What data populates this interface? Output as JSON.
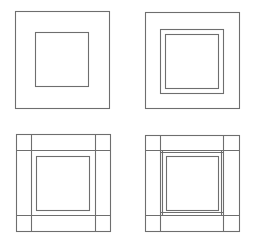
{
  "diagram": {
    "stroke_color": "#6e6e6e",
    "background": "#ffffff",
    "panels": [
      {
        "id": "panel-1",
        "position": "top-left",
        "outer_square": {
          "x": 15,
          "y": 11,
          "w": 94,
          "h": 97
        },
        "inner_squares": [
          {
            "x": 35,
            "y": 32,
            "w": 53,
            "h": 54
          }
        ],
        "vertical_lines": [],
        "horizontal_lines": []
      },
      {
        "id": "panel-2",
        "position": "top-right",
        "outer_square": {
          "x": 145,
          "y": 12,
          "w": 94,
          "h": 96
        },
        "inner_squares": [
          {
            "x": 160,
            "y": 29,
            "w": 63,
            "h": 64
          },
          {
            "x": 165,
            "y": 34,
            "w": 53,
            "h": 54
          }
        ],
        "vertical_lines": [],
        "horizontal_lines": []
      },
      {
        "id": "panel-3",
        "position": "bottom-left",
        "outer_square": {
          "x": 16,
          "y": 134,
          "w": 94,
          "h": 97
        },
        "inner_squares": [
          {
            "x": 36,
            "y": 156,
            "w": 53,
            "h": 54
          }
        ],
        "vertical_lines": [
          31,
          95
        ],
        "horizontal_lines": [
          150,
          215
        ]
      },
      {
        "id": "panel-4",
        "position": "bottom-right",
        "outer_square": {
          "x": 145,
          "y": 135,
          "w": 94,
          "h": 96
        },
        "inner_squares": [
          {
            "x": 166,
            "y": 156,
            "w": 52,
            "h": 54
          }
        ],
        "vertical_lines": [
          160,
          223
        ],
        "horizontal_lines": [
          150,
          215
        ],
        "inner_frame_lines": {
          "verticals": [
            {
              "x": 162,
              "y1": 150,
              "y2": 215
            },
            {
              "x": 221,
              "y1": 150,
              "y2": 215
            }
          ],
          "horizontals": [
            {
              "y": 152,
              "x1": 160,
              "x2": 223
            },
            {
              "y": 212,
              "x1": 160,
              "x2": 223
            }
          ]
        }
      }
    ]
  }
}
